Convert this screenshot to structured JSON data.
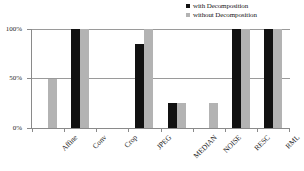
{
  "chart_data": {
    "type": "bar",
    "title": "",
    "xlabel": "",
    "ylabel": "",
    "ylim": [
      0,
      100
    ],
    "yticks": [
      "0%",
      "50%",
      "100%"
    ],
    "ytick_values": [
      0,
      50,
      100
    ],
    "grid": true,
    "legend_position": "top-right",
    "categories": [
      "Affine",
      "Conv",
      "Crop",
      "JPEG",
      "MEDIAN",
      "NOISE",
      "RESC",
      "RML"
    ],
    "series": [
      {
        "name": "with Decomposition",
        "color": "#111111",
        "values": [
          0,
          100,
          0,
          85,
          25,
          0,
          100,
          100
        ]
      },
      {
        "name": "without Decomposition",
        "color": "#b3b3b3",
        "values": [
          50,
          100,
          0,
          100,
          25,
          25,
          100,
          100
        ]
      }
    ]
  },
  "legend": {
    "entries": [
      {
        "label": "with Decomposition",
        "swatch": "legend-swatch-black"
      },
      {
        "label": "without Decomposition",
        "swatch": "legend-swatch-gray"
      }
    ]
  },
  "axes": {
    "y": {
      "labels": [
        "100%",
        "50%",
        "0%"
      ]
    },
    "x": {
      "labels": [
        "Affine",
        "Conv",
        "Crop",
        "JPEG",
        "MEDIAN",
        "NOISE",
        "RESC",
        "RML"
      ]
    }
  }
}
